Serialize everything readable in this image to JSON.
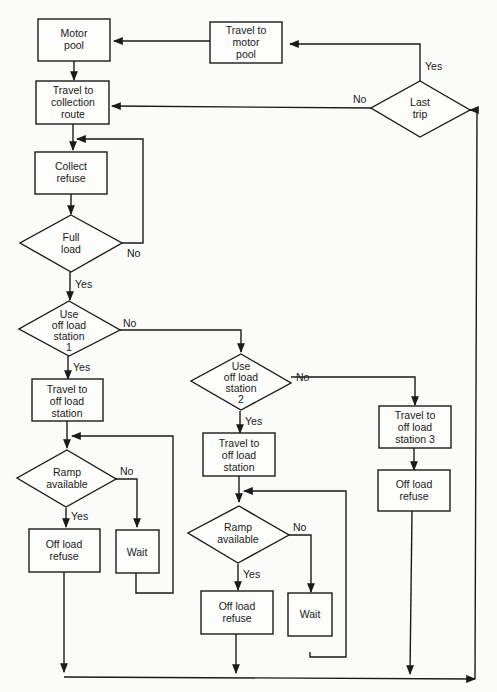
{
  "diagram": {
    "type": "flowchart",
    "nodes": {
      "motor_pool": {
        "lines": [
          "Motor",
          "pool"
        ]
      },
      "travel_motor_pool": {
        "lines": [
          "Travel to",
          "motor",
          "pool"
        ]
      },
      "last_trip": {
        "lines": [
          "Last",
          "trip"
        ]
      },
      "travel_collection": {
        "lines": [
          "Travel to",
          "collection",
          "route"
        ]
      },
      "collect_refuse": {
        "lines": [
          "Collect",
          "refuse"
        ]
      },
      "full_load": {
        "lines": [
          "Full",
          "load"
        ]
      },
      "use_station1": {
        "lines": [
          "Use",
          "off load",
          "station",
          "1"
        ]
      },
      "travel_station1": {
        "lines": [
          "Travel to",
          "off load",
          "station"
        ]
      },
      "ramp1": {
        "lines": [
          "Ramp",
          "available"
        ]
      },
      "offload1": {
        "lines": [
          "Off load",
          "refuse"
        ]
      },
      "wait1": {
        "lines": [
          "Wait"
        ]
      },
      "use_station2": {
        "lines": [
          "Use",
          "off load",
          "station",
          "2"
        ]
      },
      "travel_station2": {
        "lines": [
          "Travel to",
          "off load",
          "station"
        ]
      },
      "ramp2": {
        "lines": [
          "Ramp",
          "available"
        ]
      },
      "offload2": {
        "lines": [
          "Off load",
          "refuse"
        ]
      },
      "wait2": {
        "lines": [
          "Wait"
        ]
      },
      "travel_station3": {
        "lines": [
          "Travel to",
          "off load",
          "station 3"
        ]
      },
      "offload3": {
        "lines": [
          "Off load",
          "refuse"
        ]
      }
    },
    "edge_labels": {
      "last_trip_yes": "Yes",
      "last_trip_no": "No",
      "full_load_no": "No",
      "full_load_yes": "Yes",
      "station1_no": "No",
      "station1_yes": "Yes",
      "ramp1_no": "No",
      "ramp1_yes": "Yes",
      "station2_no": "No",
      "station2_yes": "Yes",
      "ramp2_no": "No",
      "ramp2_yes": "Yes"
    }
  }
}
